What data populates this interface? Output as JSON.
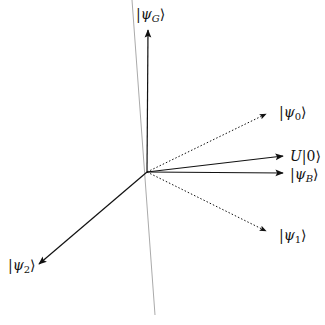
{
  "diagram": {
    "origin": [
      147,
      172
    ],
    "reference_line": {
      "from": [
        132,
        0
      ],
      "to": [
        155,
        315
      ],
      "color": "#aaaaaa"
    },
    "vectors": [
      {
        "id": "psi_G",
        "to": [
          148,
          28
        ],
        "style": "solid",
        "label_base": "ψ",
        "label_sub": "G"
      },
      {
        "id": "psi_0",
        "to": [
          268,
          113
        ],
        "style": "dotted",
        "label_base": "ψ",
        "label_sub": "0"
      },
      {
        "id": "U0",
        "to": [
          285,
          156
        ],
        "style": "solid",
        "label_text": "U|0⟩"
      },
      {
        "id": "psi_B",
        "to": [
          285,
          172
        ],
        "style": "solid",
        "label_base": "ψ",
        "label_sub": "B"
      },
      {
        "id": "psi_1",
        "to": [
          268,
          232
        ],
        "style": "dotted",
        "label_base": "ψ",
        "label_sub": "1"
      },
      {
        "id": "psi_2",
        "to": [
          37,
          265
        ],
        "style": "solid",
        "label_base": "ψ",
        "label_sub": "2"
      }
    ]
  },
  "labels": {
    "psi_G": {
      "bar": "|",
      "base": "ψ",
      "sub": "G",
      "close": "⟩"
    },
    "psi_0": {
      "bar": "|",
      "base": "ψ",
      "sub": "0",
      "close": "⟩"
    },
    "U0": {
      "op": "U",
      "ket": "|0⟩"
    },
    "psi_B": {
      "bar": "|",
      "base": "ψ",
      "sub": "B",
      "close": "⟩"
    },
    "psi_1": {
      "bar": "|",
      "base": "ψ",
      "sub": "1",
      "close": "⟩"
    },
    "psi_2": {
      "bar": "|",
      "base": "ψ",
      "sub": "2",
      "close": "⟩"
    }
  }
}
